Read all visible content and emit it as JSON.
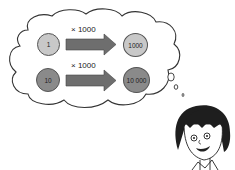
{
  "scene": {
    "description": "Cartoon girl thinking; thought cloud shows coins multiplied by 1000",
    "rows": [
      {
        "from_value": "1",
        "operation": "× 1000",
        "to_value": "1000",
        "shade": "light"
      },
      {
        "from_value": "10",
        "operation": "× 1000",
        "to_value": "10 000",
        "shade": "dark"
      }
    ]
  },
  "colors": {
    "coin_light": "#c8c8c8",
    "coin_dark": "#8a8a8a",
    "arrow": "#6e6e6e",
    "outline": "#333333",
    "background": "#ffffff"
  }
}
